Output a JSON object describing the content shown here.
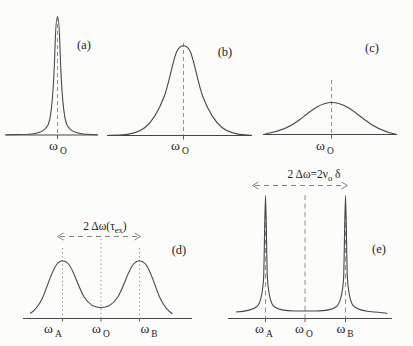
{
  "colors": {
    "background": "#fcfcfa",
    "curve": "#474747",
    "guide": "#909090",
    "text": "#1d1d1d"
  },
  "panels": {
    "a": {
      "label": "(a)",
      "xlabel": {
        "base": "ω",
        "sub": "O"
      }
    },
    "b": {
      "label": "(b)",
      "xlabel": {
        "base": "ω",
        "sub": "O"
      }
    },
    "c": {
      "label": "(c)",
      "xlabel": {
        "base": "ω",
        "sub": "O"
      }
    },
    "d": {
      "label": "(d)",
      "xlabelA": {
        "base": "ω",
        "sub": "A"
      },
      "xlabelO": {
        "base": "ω",
        "sub": "O"
      },
      "xlabelB": {
        "base": "ω",
        "sub": "B"
      },
      "annotation": {
        "pre": "2 Δω(τ",
        "sub": "ex",
        "post": ")"
      }
    },
    "e": {
      "label": "(e)",
      "xlabelA": {
        "base": "ω",
        "sub": "A"
      },
      "xlabelO": {
        "base": "ω",
        "sub": "O"
      },
      "xlabelB": {
        "base": "ω",
        "sub": "B"
      },
      "annotation": {
        "pre": "2 Δω=2ν",
        "sub": "o",
        "post": " δ"
      }
    }
  }
}
